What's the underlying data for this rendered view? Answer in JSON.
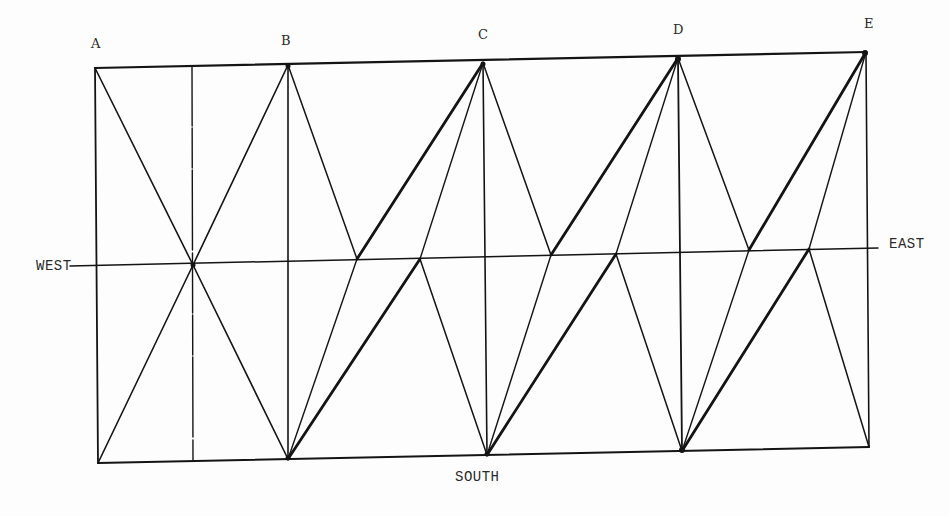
{
  "diagram": {
    "type": "truss-diagram",
    "node_labels": {
      "A": "A",
      "B": "B",
      "C": "C",
      "D": "D",
      "E": "E"
    },
    "direction_labels": {
      "west": "WEST",
      "east": "EAST",
      "south": "SOUTH"
    },
    "colors": {
      "line": "#141414",
      "text": "#2a2a2a",
      "background": "#fdfdfd"
    },
    "points": {
      "A_top": [
        95,
        68
      ],
      "B_top": [
        288,
        65
      ],
      "C_top": [
        483,
        63
      ],
      "D_top": [
        678,
        58
      ],
      "E_top": [
        866,
        52
      ],
      "A_bot": [
        98,
        463
      ],
      "B_bot": [
        288,
        459
      ],
      "C_bot": [
        487,
        455
      ],
      "D_bot": [
        682,
        451
      ],
      "E_bot": [
        869,
        447
      ],
      "M": [
        193,
        265
      ],
      "P1": [
        357,
        259
      ],
      "P2": [
        420,
        259
      ],
      "P3": [
        551,
        255
      ],
      "P4": [
        616,
        254
      ],
      "P5": [
        749,
        250
      ],
      "P6": [
        809,
        249
      ]
    }
  }
}
